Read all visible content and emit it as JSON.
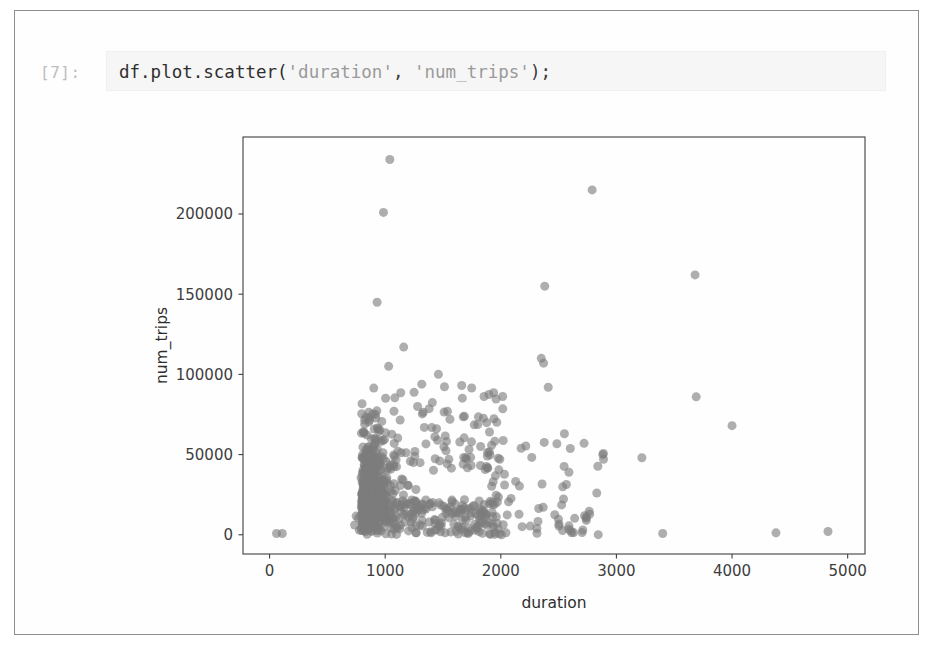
{
  "notebook": {
    "prompt": "[7]:",
    "code": "df.plot.scatter('duration', 'num_trips');",
    "code_tokens": [
      {
        "t": "df.plot.scatter(",
        "k": "code"
      },
      {
        "t": "'duration'",
        "k": "str"
      },
      {
        "t": ", ",
        "k": "punc"
      },
      {
        "t": "'num_trips'",
        "k": "str"
      },
      {
        "t": ");",
        "k": "punc"
      }
    ]
  },
  "colors": {
    "marker": "#7d7d7d",
    "axis": "#3f3f3f",
    "text": "#2e2e2e",
    "prompt": "#bdbdbd",
    "input_background": "#f6f6f6",
    "page_background": "#ffffff",
    "frame_border": "#8d8d8d"
  },
  "chart_data": {
    "type": "scatter",
    "title": "",
    "xlabel": "duration",
    "ylabel": "num_trips",
    "xlim": [
      -230,
      5150
    ],
    "ylim": [
      -12000,
      248000
    ],
    "xticks": [
      0,
      1000,
      2000,
      3000,
      4000,
      5000
    ],
    "xticklabels": [
      "0",
      "1000",
      "2000",
      "3000",
      "4000",
      "5000"
    ],
    "yticks": [
      0,
      50000,
      100000,
      150000,
      200000
    ],
    "yticklabels": [
      "0",
      "50000",
      "100000",
      "150000",
      "200000"
    ],
    "grid": false,
    "legend": null,
    "marker": {
      "shape": "circle",
      "size": 9,
      "color": "#7d7d7d",
      "alpha": 0.62
    },
    "series": [
      {
        "name": "num_trips vs duration",
        "n_points_approx": 900,
        "notable_points": [
          {
            "x": 1040,
            "y": 234000
          },
          {
            "x": 985,
            "y": 201000
          },
          {
            "x": 2790,
            "y": 215000
          },
          {
            "x": 3680,
            "y": 162000
          },
          {
            "x": 2380,
            "y": 155000
          },
          {
            "x": 930,
            "y": 145000
          },
          {
            "x": 1160,
            "y": 117000
          },
          {
            "x": 1030,
            "y": 105000
          },
          {
            "x": 2350,
            "y": 110000
          },
          {
            "x": 2370,
            "y": 107000
          },
          {
            "x": 1460,
            "y": 100000
          },
          {
            "x": 2410,
            "y": 92000
          },
          {
            "x": 3690,
            "y": 86000
          },
          {
            "x": 1280,
            "y": 80000
          },
          {
            "x": 1560,
            "y": 72000
          },
          {
            "x": 4000,
            "y": 68000
          },
          {
            "x": 2550,
            "y": 63000
          },
          {
            "x": 2720,
            "y": 57000
          },
          {
            "x": 3220,
            "y": 48000
          },
          {
            "x": 2830,
            "y": 26000
          },
          {
            "x": 2740,
            "y": 11000
          },
          {
            "x": 60,
            "y": 800
          },
          {
            "x": 110,
            "y": 800
          },
          {
            "x": 3400,
            "y": 800
          },
          {
            "x": 4380,
            "y": 1200
          },
          {
            "x": 4830,
            "y": 2000
          }
        ],
        "cluster": {
          "x_range": [
            680,
            2100
          ],
          "y_range": [
            0,
            80000
          ],
          "x_mode": 1250,
          "y_mode": 26000,
          "description": "dense overplotted cloud of grey markers concentrated between duration 700-2000 and num_trips 0-70000, thinning toward the upper right"
        }
      }
    ]
  }
}
